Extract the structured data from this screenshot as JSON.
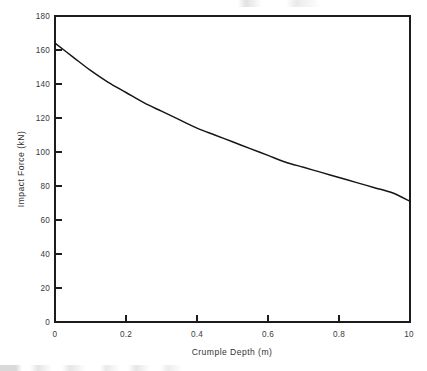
{
  "chart_data": {
    "type": "line",
    "title": "",
    "subtitle": "",
    "xlabel": "Crumple Depth (m)",
    "ylabel": "Impact Force (kN)",
    "xlim": [
      0,
      1.0
    ],
    "ylim": [
      0,
      180
    ],
    "grid": false,
    "legend": false,
    "legend_position": "none",
    "xticks": [
      0,
      0.2,
      0.4,
      0.6,
      0.8,
      1.0
    ],
    "xtick_labels": [
      "0",
      "0.2",
      "0.4",
      "0.6",
      "0.8",
      "10"
    ],
    "yticks": [
      0,
      20,
      40,
      60,
      80,
      100,
      120,
      140,
      160,
      180
    ],
    "ytick_labels": [
      "0",
      "20",
      "40",
      "60",
      "80",
      "100",
      "120",
      "140",
      "160",
      "180"
    ],
    "series": [
      {
        "name": "Impact Force vs Crumple Depth",
        "color": "#151515",
        "x": [
          0.0,
          0.05,
          0.1,
          0.15,
          0.2,
          0.25,
          0.3,
          0.35,
          0.4,
          0.45,
          0.5,
          0.55,
          0.6,
          0.65,
          0.7,
          0.75,
          0.8,
          0.85,
          0.9,
          0.95,
          1.0
        ],
        "y": [
          164,
          156,
          148,
          141,
          135,
          129,
          124,
          119,
          114,
          110,
          106,
          102,
          98,
          94,
          91,
          88,
          85,
          82,
          79,
          76,
          71
        ]
      }
    ],
    "annotations": []
  },
  "axes": {
    "x_axis_name": "Crumple Depth (m)",
    "y_axis_name": "Impact Force (kN)"
  },
  "colors": {
    "background": "#ffffff",
    "frame": "#1c1c1c",
    "curve": "#151515",
    "text": "#333333"
  }
}
